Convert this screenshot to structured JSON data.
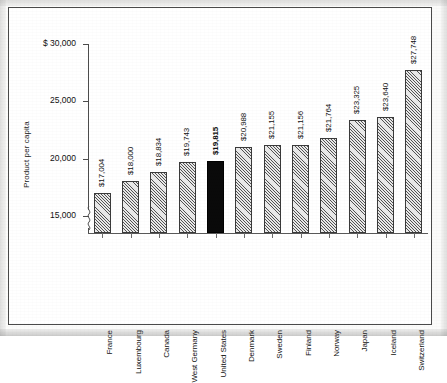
{
  "chart_data": {
    "type": "bar",
    "title": "",
    "xlabel": "",
    "ylabel": "Product per capita",
    "categories": [
      "France",
      "Luxembourg",
      "Canada",
      "West Germany",
      "United States",
      "Denmark",
      "Sweden",
      "Finland",
      "Norway",
      "Japan",
      "Iceland",
      "Switzerland"
    ],
    "values": [
      17004,
      18000,
      18834,
      19743,
      19815,
      20988,
      21155,
      21156,
      21764,
      23325,
      23640,
      27748
    ],
    "value_labels": [
      "$17,004",
      "$18,000",
      "$18,834",
      "$19,743",
      "$19,815",
      "$20,988",
      "$21,155",
      "$21,156",
      "$21,764",
      "$23,325",
      "$23,640",
      "$27,748"
    ],
    "ylim": [
      13500,
      30000
    ],
    "axis_break": true,
    "axis_break_below": 15000,
    "ytick_values": [
      30000,
      25000,
      20000,
      15000
    ],
    "ytick_labels": [
      "$ 30,000",
      "25,000",
      "20,000",
      "15,000"
    ],
    "grid": false,
    "legend": "none",
    "highlight_category": "United States",
    "highlight_color": "#0a0a0a",
    "bar_fill": "diagonal-hatch",
    "bar_fill_color": "#e9e9e9",
    "bar_edge_color": "#3a3a3a"
  },
  "axis": {
    "y_title": "Product per capita",
    "ticks": [
      {
        "label": "$ 30,000",
        "value": 30000
      },
      {
        "label": "25,000",
        "value": 25000
      },
      {
        "label": "20,000",
        "value": 20000
      },
      {
        "label": "15,000",
        "value": 15000
      }
    ]
  },
  "bars": [
    {
      "category": "France",
      "value": 17004,
      "label": "$17,004",
      "highlight": false
    },
    {
      "category": "Luxembourg",
      "value": 18000,
      "label": "$18,000",
      "highlight": false
    },
    {
      "category": "Canada",
      "value": 18834,
      "label": "$18,834",
      "highlight": false
    },
    {
      "category": "West Germany",
      "value": 19743,
      "label": "$19,743",
      "highlight": false
    },
    {
      "category": "United States",
      "value": 19815,
      "label": "$19,815",
      "highlight": true
    },
    {
      "category": "Denmark",
      "value": 20988,
      "label": "$20,988",
      "highlight": false
    },
    {
      "category": "Sweden",
      "value": 21155,
      "label": "$21,155",
      "highlight": false
    },
    {
      "category": "Finland",
      "value": 21156,
      "label": "$21,156",
      "highlight": false
    },
    {
      "category": "Norway",
      "value": 21764,
      "label": "$21,764",
      "highlight": false
    },
    {
      "category": "Japan",
      "value": 23325,
      "label": "$23,325",
      "highlight": false
    },
    {
      "category": "Iceland",
      "value": 23640,
      "label": "$23,640",
      "highlight": false
    },
    {
      "category": "Switzerland",
      "value": 27748,
      "label": "$27,748",
      "highlight": false
    }
  ],
  "colors": {
    "frame": "#4a4a4a",
    "axis": "#4d4d4d",
    "text": "#111111",
    "bar_fill": "#e9e9e9",
    "bar_edge": "#3a3a3a",
    "highlight": "#0a0a0a",
    "background": "#ffffff"
  }
}
